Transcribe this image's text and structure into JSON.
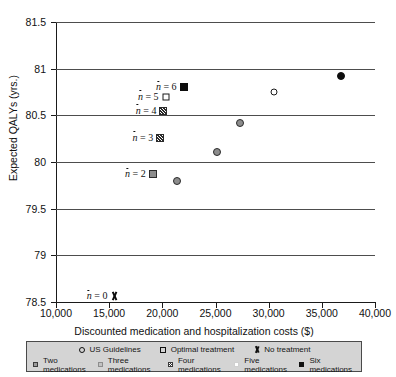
{
  "chart_data": {
    "type": "scatter",
    "title": "",
    "xlabel": "Discounted medication and hospitalization costs ($)",
    "ylabel": "Expected QALYs (yrs.)",
    "xlim": [
      10000,
      40000
    ],
    "ylim": [
      78.5,
      81.5
    ],
    "xticks": [
      "10,000",
      "15,000",
      "20,000",
      "25,000",
      "30,000",
      "35,000",
      "40,000"
    ],
    "xtick_values": [
      10000,
      15000,
      20000,
      25000,
      30000,
      35000,
      40000
    ],
    "yticks": [
      "78.5",
      "79",
      "79.5",
      "80",
      "80.5",
      "81",
      "81.5"
    ],
    "ytick_values": [
      78.5,
      79,
      79.5,
      80,
      80.5,
      81,
      81.5
    ],
    "grid": "horizontal",
    "legend_position": "below-axis",
    "points": [
      {
        "name": "no-treatment",
        "label": "No treatment",
        "marker": "cross",
        "x": 15500,
        "y": 78.56,
        "annotation": "n = 0"
      },
      {
        "name": "two-medications",
        "label": "Two medications",
        "marker": "grey-square",
        "x": 19100,
        "y": 79.87,
        "annotation": "n = 2"
      },
      {
        "name": "three-medications",
        "label": "Three medications",
        "marker": "hatch-square",
        "x": 19800,
        "y": 80.26,
        "annotation": "n = 3"
      },
      {
        "name": "four-medications",
        "label": "Four medications",
        "marker": "hatch-square",
        "x": 20100,
        "y": 80.55,
        "annotation": "n = 4"
      },
      {
        "name": "five-medications",
        "label": "Five medications",
        "marker": "open-square",
        "x": 20300,
        "y": 80.7,
        "annotation": "n = 5"
      },
      {
        "name": "six-medications",
        "label": "Six medications",
        "marker": "filled-square",
        "x": 22000,
        "y": 80.8,
        "annotation": "n = 6"
      },
      {
        "name": "us-guidelines-low",
        "label": "US Guidelines",
        "marker": "grey-circle",
        "x": 21400,
        "y": 79.8,
        "annotation": ""
      },
      {
        "name": "us-guidelines-mid",
        "label": "US Guidelines",
        "marker": "grey-circle",
        "x": 25100,
        "y": 80.11,
        "annotation": ""
      },
      {
        "name": "us-guidelines-upper",
        "label": "US Guidelines",
        "marker": "grey-circle",
        "x": 27300,
        "y": 80.42,
        "annotation": ""
      },
      {
        "name": "us-guidelines-open",
        "label": "US Guidelines",
        "marker": "open-circle",
        "x": 30500,
        "y": 80.75,
        "annotation": ""
      },
      {
        "name": "optimal-treatment",
        "label": "Optimal treatment",
        "marker": "filled-circle",
        "x": 36800,
        "y": 80.92,
        "annotation": ""
      }
    ],
    "annotations": [
      {
        "text": "n = 6",
        "x": 22000,
        "y": 80.8
      },
      {
        "text": "n = 5",
        "x": 20300,
        "y": 80.7
      },
      {
        "text": "n = 4",
        "x": 20100,
        "y": 80.55
      },
      {
        "text": "n = 3",
        "x": 19800,
        "y": 80.26
      },
      {
        "text": "n = 2",
        "x": 19100,
        "y": 79.87
      },
      {
        "text": "n = 0",
        "x": 15500,
        "y": 78.56
      }
    ],
    "legend": {
      "row1": [
        {
          "marker": "open-circle",
          "label": "US Guidelines"
        },
        {
          "marker": "open-square",
          "label": "Optimal treatment"
        },
        {
          "marker": "cross",
          "label": "No treatment"
        }
      ],
      "row2": [
        {
          "marker": "grey-square",
          "label": "Two medications"
        },
        {
          "marker": "light-grey-square",
          "label": "Three medications"
        },
        {
          "marker": "hatch-square",
          "label": "Four medications"
        },
        {
          "marker": "white-square",
          "label": "Five medications"
        },
        {
          "marker": "black-square",
          "label": "Six medications"
        }
      ]
    }
  },
  "colors": {
    "grid": "#4d4d4d",
    "axis": "#1a1a1a",
    "marker_dark": "#0d0d0d",
    "marker_grey": "#8c8c8c",
    "legend_background": "#d4d4d4",
    "legend_border": "#4a4a4a"
  }
}
